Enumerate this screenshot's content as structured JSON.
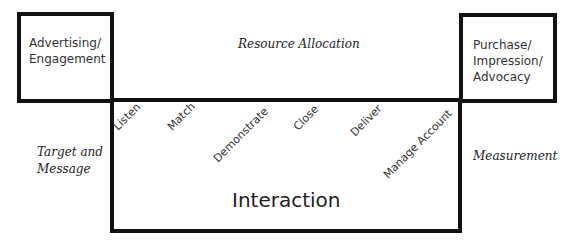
{
  "diagram": {
    "left_box": {
      "text_line1": "Advertising/",
      "text_line2": "Engagement"
    },
    "right_box": {
      "text_line1": "Purchase/",
      "text_line2": "Impression/",
      "text_line3": "Advocacy"
    },
    "top_label": "Resource Allocation",
    "left_label": {
      "line1": "Target and",
      "line2": "Message"
    },
    "right_label": "Measurement",
    "center_label": "Interaction",
    "steps": [
      "Listen",
      "Match",
      "Demonstrate",
      "Close",
      "Deliver",
      "Manage Account"
    ]
  }
}
